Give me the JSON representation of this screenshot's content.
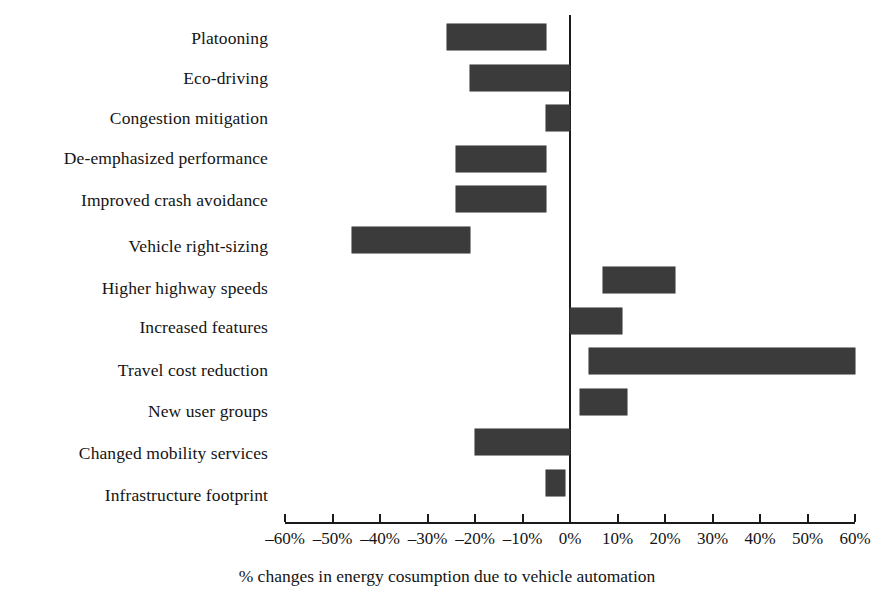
{
  "chart_data": {
    "type": "bar",
    "orientation": "horizontal",
    "subtype": "floating-range-bar",
    "title": "",
    "xlabel": "% changes in energy cosumption due to vehicle automation",
    "ylabel": "",
    "xlim": [
      -60,
      60
    ],
    "grid": false,
    "legend": null,
    "axis_zero_line": true,
    "xticks": [
      -60,
      -50,
      -40,
      -30,
      -20,
      -10,
      0,
      10,
      20,
      30,
      40,
      50,
      60
    ],
    "xtick_labels": [
      "–60%",
      "–50%",
      "–40%",
      "–30%",
      "–20%",
      "–10%",
      "0%",
      "10%",
      "20%",
      "30%",
      "40%",
      "50%",
      "60%"
    ],
    "bar_color": "#3b3b3b",
    "categories": [
      "Platooning",
      "Eco-driving",
      "Congestion mitigation",
      "De-emphasized performance",
      "Improved crash avoidance",
      "Vehicle right-sizing",
      "Higher highway speeds",
      "Increased features",
      "Travel cost reduction",
      "New user groups",
      "Changed mobility services",
      "Infrastructure footprint"
    ],
    "ranges": [
      {
        "label": "Platooning",
        "low": -26,
        "high": -5
      },
      {
        "label": "Eco-driving",
        "low": -21,
        "high": 0
      },
      {
        "label": "Congestion mitigation",
        "low": -5,
        "high": 0
      },
      {
        "label": "De-emphasized performance",
        "low": -24,
        "high": -5
      },
      {
        "label": "Improved crash avoidance",
        "low": -24,
        "high": -5
      },
      {
        "label": "Vehicle right-sizing",
        "low": -46,
        "high": -21
      },
      {
        "label": "Higher highway speeds",
        "low": 7,
        "high": 22
      },
      {
        "label": "Increased features",
        "low": 0,
        "high": 11
      },
      {
        "label": "Travel cost reduction",
        "low": 4,
        "high": 60
      },
      {
        "label": "New user groups",
        "low": 2,
        "high": 12
      },
      {
        "label": "Changed mobility services",
        "low": -20,
        "high": 0
      },
      {
        "label": "Infrastructure footprint",
        "low": -5,
        "high": -1
      }
    ]
  }
}
